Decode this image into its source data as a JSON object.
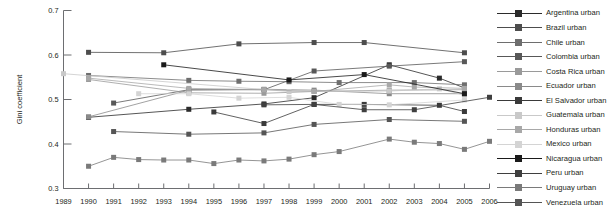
{
  "chart_data": {
    "type": "line",
    "title": "",
    "xlabel": "",
    "ylabel": "Gini coefficient",
    "ylim": [
      0.3,
      0.7
    ],
    "ytick_labels": [
      "0.3",
      "0.4",
      "0.5",
      "0.6",
      "0.7"
    ],
    "ytick_values": [
      0.3,
      0.4,
      0.5,
      0.6,
      0.7
    ],
    "xlim": [
      1989,
      2006
    ],
    "x": [
      1989,
      1990,
      1991,
      1992,
      1993,
      1994,
      1995,
      1996,
      1997,
      1998,
      1999,
      2000,
      2001,
      2002,
      2003,
      2004,
      2005,
      2006
    ],
    "xtick_labels": [
      "1989",
      "1990",
      "1991",
      "1992",
      "1993",
      "1994",
      "1995",
      "1996",
      "1997",
      "1998",
      "1999",
      "2000",
      "2001",
      "2002",
      "2003",
      "2004",
      "2005",
      "2006"
    ],
    "grid": false,
    "legend_position": "right",
    "marker": "square",
    "series": [
      {
        "name": "Argentina urban",
        "color": "#2b2b2b",
        "points": [
          {
            "x": 1990,
            "y": 0.46
          },
          {
            "x": 1994,
            "y": 0.478
          },
          {
            "x": 1997,
            "y": 0.49
          },
          {
            "x": 1999,
            "y": 0.504
          },
          {
            "x": 2002,
            "y": 0.578
          },
          {
            "x": 2004,
            "y": 0.548
          },
          {
            "x": 2005,
            "y": 0.526
          }
        ]
      },
      {
        "name": "Brazil urban",
        "color": "#4d4d4d",
        "points": [
          {
            "x": 1990,
            "y": 0.606
          },
          {
            "x": 1993,
            "y": 0.605
          },
          {
            "x": 1996,
            "y": 0.625
          },
          {
            "x": 1999,
            "y": 0.628
          },
          {
            "x": 2001,
            "y": 0.628
          },
          {
            "x": 2005,
            "y": 0.605
          }
        ]
      },
      {
        "name": "Chile urban",
        "color": "#6e6e6e",
        "points": [
          {
            "x": 1990,
            "y": 0.554
          },
          {
            "x": 1994,
            "y": 0.543
          },
          {
            "x": 1996,
            "y": 0.541
          },
          {
            "x": 1998,
            "y": 0.54
          },
          {
            "x": 2000,
            "y": 0.538
          },
          {
            "x": 2003,
            "y": 0.538
          },
          {
            "x": 2005,
            "y": 0.533
          }
        ]
      },
      {
        "name": "Colombia urban",
        "color": "#585858",
        "points": [
          {
            "x": 1991,
            "y": 0.492
          },
          {
            "x": 1994,
            "y": 0.522
          },
          {
            "x": 1997,
            "y": 0.522
          },
          {
            "x": 1999,
            "y": 0.564
          },
          {
            "x": 2002,
            "y": 0.575
          },
          {
            "x": 2005,
            "y": 0.585
          }
        ]
      },
      {
        "name": "Costa Rica urban",
        "color": "#9a9a9a",
        "points": [
          {
            "x": 1990,
            "y": 0.545
          },
          {
            "x": 1994,
            "y": 0.515
          },
          {
            "x": 1997,
            "y": 0.514
          },
          {
            "x": 1999,
            "y": 0.518
          },
          {
            "x": 2002,
            "y": 0.521
          },
          {
            "x": 2005,
            "y": 0.522
          }
        ]
      },
      {
        "name": "Ecuador urban",
        "color": "#8a8a8a",
        "points": [
          {
            "x": 1990,
            "y": 0.461
          },
          {
            "x": 1994,
            "y": 0.521
          },
          {
            "x": 1997,
            "y": 0.523
          },
          {
            "x": 1999,
            "y": 0.521
          },
          {
            "x": 2002,
            "y": 0.513
          },
          {
            "x": 2005,
            "y": 0.513
          }
        ]
      },
      {
        "name": "El Salvador urban",
        "color": "#3a3a3a",
        "points": [
          {
            "x": 1995,
            "y": 0.472
          },
          {
            "x": 1997,
            "y": 0.446
          },
          {
            "x": 1999,
            "y": 0.489
          },
          {
            "x": 2001,
            "y": 0.489
          },
          {
            "x": 2004,
            "y": 0.487
          },
          {
            "x": 2005,
            "y": 0.473
          }
        ]
      },
      {
        "name": "Guatemala urban",
        "color": "#c9c9c9",
        "points": [
          {
            "x": 1989,
            "y": 0.558
          },
          {
            "x": 1998,
            "y": 0.518
          },
          {
            "x": 2002,
            "y": 0.519
          },
          {
            "x": 2004,
            "y": 0.524
          },
          {
            "x": 2005,
            "y": 0.51
          }
        ]
      },
      {
        "name": "Honduras urban",
        "color": "#a8a8a8",
        "points": [
          {
            "x": 1990,
            "y": 0.548
          },
          {
            "x": 1994,
            "y": 0.525
          },
          {
            "x": 1997,
            "y": 0.522
          },
          {
            "x": 1999,
            "y": 0.518
          },
          {
            "x": 2002,
            "y": 0.533
          },
          {
            "x": 2003,
            "y": 0.528
          },
          {
            "x": 2005,
            "y": 0.525
          }
        ]
      },
      {
        "name": "Mexico urban",
        "color": "#d4d4d4",
        "points": [
          {
            "x": 1992,
            "y": 0.513
          },
          {
            "x": 1994,
            "y": 0.513
          },
          {
            "x": 1996,
            "y": 0.503
          },
          {
            "x": 1998,
            "y": 0.505
          },
          {
            "x": 2000,
            "y": 0.489
          },
          {
            "x": 2002,
            "y": 0.488
          },
          {
            "x": 2005,
            "y": 0.499
          }
        ]
      },
      {
        "name": "Nicaragua urban",
        "color": "#1a1a1a",
        "points": [
          {
            "x": 1993,
            "y": 0.578
          },
          {
            "x": 1998,
            "y": 0.544
          },
          {
            "x": 2001,
            "y": 0.556
          },
          {
            "x": 2005,
            "y": 0.513
          }
        ]
      },
      {
        "name": "Peru urban",
        "color": "#3f3f3f",
        "points": [
          {
            "x": 1997,
            "y": 0.488
          },
          {
            "x": 1999,
            "y": 0.489
          },
          {
            "x": 2001,
            "y": 0.477
          },
          {
            "x": 2003,
            "y": 0.477
          },
          {
            "x": 2006,
            "y": 0.505
          }
        ]
      },
      {
        "name": "Uruguay urban",
        "color": "#7a7a7a",
        "points": [
          {
            "x": 1990,
            "y": 0.35
          },
          {
            "x": 1991,
            "y": 0.37
          },
          {
            "x": 1992,
            "y": 0.365
          },
          {
            "x": 1993,
            "y": 0.364
          },
          {
            "x": 1994,
            "y": 0.364
          },
          {
            "x": 1995,
            "y": 0.356
          },
          {
            "x": 1996,
            "y": 0.364
          },
          {
            "x": 1997,
            "y": 0.362
          },
          {
            "x": 1998,
            "y": 0.366
          },
          {
            "x": 1999,
            "y": 0.376
          },
          {
            "x": 2000,
            "y": 0.383
          },
          {
            "x": 2002,
            "y": 0.411
          },
          {
            "x": 2003,
            "y": 0.404
          },
          {
            "x": 2004,
            "y": 0.401
          },
          {
            "x": 2005,
            "y": 0.388
          },
          {
            "x": 2006,
            "y": 0.406
          }
        ]
      },
      {
        "name": "Venezuela urban",
        "color": "#555555",
        "points": [
          {
            "x": 1991,
            "y": 0.428
          },
          {
            "x": 1994,
            "y": 0.422
          },
          {
            "x": 1997,
            "y": 0.425
          },
          {
            "x": 1999,
            "y": 0.444
          },
          {
            "x": 2002,
            "y": 0.455
          },
          {
            "x": 2005,
            "y": 0.451
          }
        ]
      }
    ]
  },
  "legend": {
    "items": [
      {
        "label": "Argentina urban",
        "color": "#2b2b2b"
      },
      {
        "label": "Brazil urban",
        "color": "#4d4d4d"
      },
      {
        "label": "Chile urban",
        "color": "#6e6e6e"
      },
      {
        "label": "Colombia urban",
        "color": "#585858"
      },
      {
        "label": "Costa Rica urban",
        "color": "#9a9a9a"
      },
      {
        "label": "Ecuador urban",
        "color": "#8a8a8a"
      },
      {
        "label": "El Salvador urban",
        "color": "#3a3a3a"
      },
      {
        "label": "Guatemala urban",
        "color": "#c9c9c9"
      },
      {
        "label": "Honduras urban",
        "color": "#a8a8a8"
      },
      {
        "label": "Mexico urban",
        "color": "#d4d4d4"
      },
      {
        "label": "Nicaragua urban",
        "color": "#1a1a1a"
      },
      {
        "label": "Peru urban",
        "color": "#3f3f3f"
      },
      {
        "label": "Uruguay urban",
        "color": "#7a7a7a"
      },
      {
        "label": "Venezuela urban",
        "color": "#555555"
      }
    ]
  }
}
